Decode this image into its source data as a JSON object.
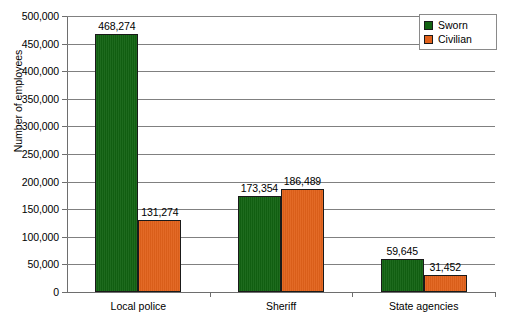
{
  "chart_data": {
    "type": "bar",
    "title": "",
    "xlabel": "",
    "ylabel": "Number of employees",
    "categories": [
      "Local police",
      "Sheriff",
      "State agencies"
    ],
    "series": [
      {
        "name": "Sworn",
        "color": "#126312",
        "values": [
          468274,
          173354,
          59645
        ],
        "value_labels": [
          "468,274",
          "173,354",
          "59,645"
        ]
      },
      {
        "name": "Civilian",
        "color": "#e2621b",
        "values": [
          131274,
          186489,
          31452
        ],
        "value_labels": [
          "131,274",
          "186,489",
          "31,452"
        ]
      }
    ],
    "ylim": [
      0,
      500000
    ],
    "ytick_values": [
      0,
      50000,
      100000,
      150000,
      200000,
      250000,
      300000,
      350000,
      400000,
      450000,
      500000
    ],
    "ytick_labels": [
      "0",
      "50,000",
      "100,000",
      "150,000",
      "200,000",
      "250,000",
      "300,000",
      "350,000",
      "400,000",
      "450,000",
      "500,000"
    ],
    "grid": true,
    "legend_position": "top-right",
    "legend_entries": [
      "Sworn",
      "Civilian"
    ]
  }
}
